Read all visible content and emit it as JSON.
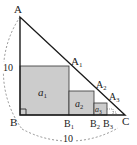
{
  "diagram": {
    "type": "geometry",
    "colors": {
      "line": "#1a1a1a",
      "square_fill": "#cccccc",
      "arc": "#888888",
      "background": "#ffffff"
    },
    "points": {
      "A": "A",
      "B": "B",
      "C": "C",
      "A1": {
        "base": "A",
        "sub": "1"
      },
      "A2": {
        "base": "A",
        "sub": "2"
      },
      "A3": {
        "base": "A",
        "sub": "3"
      },
      "B1": {
        "base": "B",
        "sub": "1"
      },
      "B2": {
        "base": "B",
        "sub": "2"
      },
      "B3": {
        "base": "B",
        "sub": "3"
      }
    },
    "squares": [
      {
        "base": "a",
        "sub": "1"
      },
      {
        "base": "a",
        "sub": "2"
      },
      {
        "base": "a",
        "sub": "3"
      }
    ],
    "dimensions": {
      "AB": "10",
      "BC": "10"
    }
  }
}
